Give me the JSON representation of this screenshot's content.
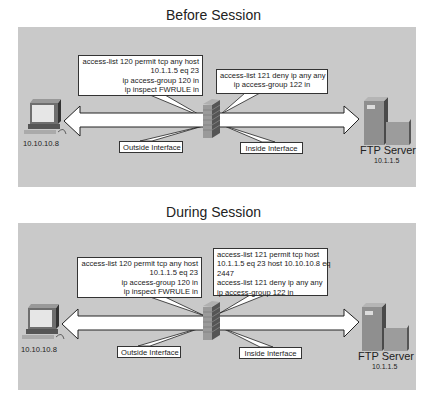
{
  "diagrams": [
    {
      "title": "Before Session",
      "outside_acl": [
        "access-list 120 permit tcp any host",
        "10.1.1.5 eq 23",
        "ip access-group 120 in",
        "ip inspect FWRULE in"
      ],
      "inside_acl": [
        "access-list 121 deny ip any any",
        "ip access-group 122 in"
      ],
      "outside_label": "Outside Interface",
      "inside_label": "Inside Interface",
      "client_ip": "10.10.10.8",
      "server_name": "FTP Server",
      "server_ip": "10.1.1.5"
    },
    {
      "title": "During Session",
      "outside_acl": [
        "access-list 120 permit tcp any host",
        "10.1.1.5 eq 23",
        "ip access-group 120 in",
        "ip inspect FWRULE in"
      ],
      "inside_acl": [
        "access-list 121 permit tcp host",
        "10.1.1.5 eq 23 host 10.10.10.8 eq",
        "2447",
        "access-list 121 deny ip any any",
        "ip access-group 122 in"
      ],
      "outside_label": "Outside Interface",
      "inside_label": "Inside Interface",
      "client_ip": "10.10.10.8",
      "server_name": "FTP Server",
      "server_ip": "10.1.1.5"
    }
  ],
  "colors": {
    "panel": "#c9c9c9",
    "firewall": "#8a8a8a",
    "arrow_fill": "#ffffff",
    "arrow_stroke": "#222222"
  },
  "icons": [
    "pc-icon",
    "firewall-icon",
    "server-icon",
    "bidirectional-arrow-icon"
  ]
}
